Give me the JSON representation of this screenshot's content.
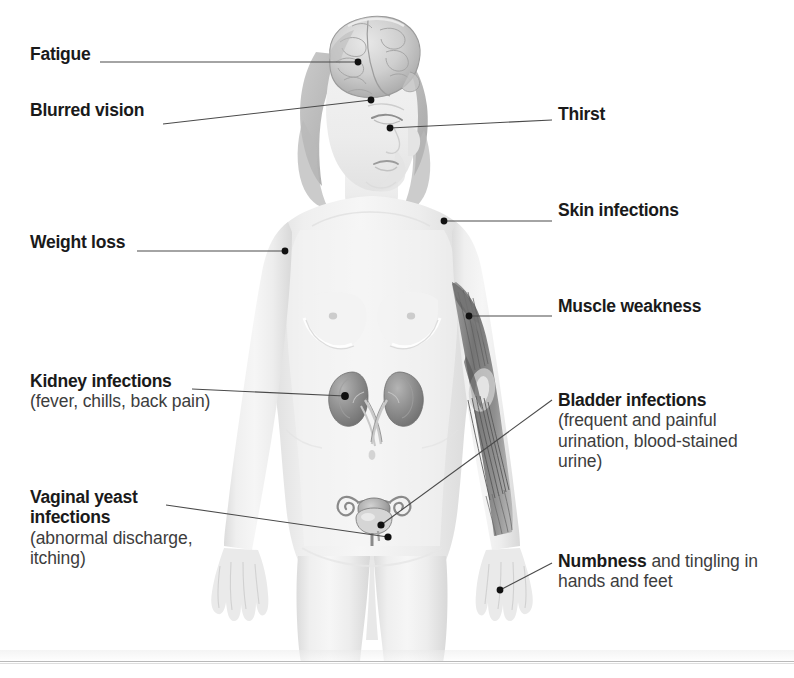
{
  "diagram": {
    "type": "medical-illustration",
    "figure_description": "Anterior view of a female body with partially exposed anatomy: brain visible in the head, kidneys and ureters in the abdomen, uterus with fallopian tubes and bladder in the pelvis, and arm musculature exposed on the figure's left arm (viewer's right)."
  },
  "callouts": [
    {
      "id": "fatigue",
      "heading": "Fatigue",
      "detail": "",
      "side": "left",
      "target": "brain",
      "label_xy": [
        30,
        44
      ],
      "dot_xy": [
        358,
        62
      ]
    },
    {
      "id": "blurred_vision",
      "heading": "Blurred vision",
      "detail": "",
      "side": "left",
      "target": "eye",
      "label_xy": [
        30,
        100
      ],
      "dot_xy": [
        371,
        100
      ]
    },
    {
      "id": "weight_loss",
      "heading": "Weight loss",
      "detail": "",
      "side": "left",
      "target": "shoulder-arm",
      "label_xy": [
        30,
        232
      ],
      "dot_xy": [
        285,
        251
      ]
    },
    {
      "id": "kidney_infections",
      "heading": "Kidney infections",
      "detail": "(fever, chills, back pain)",
      "side": "left",
      "target": "kidney",
      "label_xy": [
        30,
        371
      ],
      "dot_xy": [
        345,
        396
      ]
    },
    {
      "id": "vaginal_yeast_infections",
      "heading": "Vaginal yeast infections",
      "detail": "(abnormal discharge, itching)",
      "side": "left",
      "target": "uterus-vagina",
      "label_xy": [
        30,
        487
      ],
      "dot_xy": [
        388,
        537
      ]
    },
    {
      "id": "thirst",
      "heading": "Thirst",
      "detail": "",
      "side": "right",
      "target": "mouth",
      "label_xy": [
        558,
        104
      ],
      "dot_xy": [
        390,
        128
      ]
    },
    {
      "id": "skin_infections",
      "heading": "Skin infections",
      "detail": "",
      "side": "right",
      "target": "shoulder-skin",
      "label_xy": [
        558,
        200
      ],
      "dot_xy": [
        444,
        221
      ]
    },
    {
      "id": "muscle_weakness",
      "heading": "Muscle weakness",
      "detail": "",
      "side": "right",
      "target": "arm-muscle",
      "label_xy": [
        558,
        296
      ],
      "dot_xy": [
        469,
        316
      ]
    },
    {
      "id": "bladder_infections",
      "heading": "Bladder infections",
      "detail": "(frequent and painful urination, blood-stained urine)",
      "side": "right",
      "target": "bladder",
      "label_xy": [
        558,
        390
      ],
      "dot_xy": [
        381,
        525
      ]
    },
    {
      "id": "numbness",
      "heading": "Numbness",
      "detail": " and tingling in hands and feet",
      "side": "right",
      "target": "hand",
      "label_xy": [
        558,
        551
      ],
      "dot_xy": [
        500,
        590
      ]
    }
  ],
  "text": {
    "fatigue": "Fatigue",
    "blurred_vision": "Blurred vision",
    "weight_loss": "Weight loss",
    "kidney_heading": "Kidney infections",
    "kidney_detail": "(fever, chills, back pain)",
    "vaginal_heading_line1": "Vaginal yeast",
    "vaginal_heading_line2": "infections",
    "vaginal_detail": "(abnormal discharge, itching)",
    "thirst": "Thirst",
    "skin_infections": "Skin infections",
    "muscle_weakness": "Muscle weakness",
    "bladder_heading": "Bladder infections",
    "bladder_detail": "(frequent and painful urination, blood-stained urine)",
    "numbness_bold": "Numbness",
    "numbness_rest": " and tingling in hands and feet"
  },
  "colors": {
    "background": "#ffffff",
    "heading_text": "#1a1a1a",
    "detail_text": "#3d3d3d",
    "leader_line": "#4a4a4a",
    "dot": "#111111",
    "body_fill": "#efefef",
    "body_shade": "#dcdcdc",
    "organ_fill": "#8e8e8e",
    "muscle_fill": "#7a7a7a",
    "hair_fill": "#b5b5b5",
    "rule": "#b9b9b9"
  }
}
